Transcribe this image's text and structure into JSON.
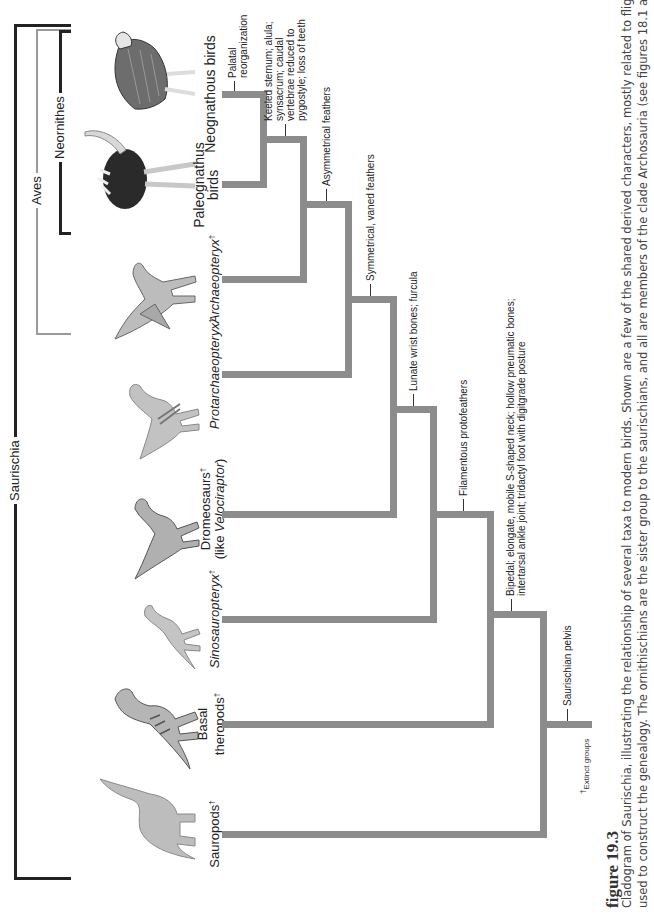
{
  "orientation": "rotated 90 degrees counterclockwise",
  "figure": {
    "title": "figure 19.3",
    "caption_line1": "Cladogram of Saurischia, illustrating the relationship of several taxa to modern birds. Shown are a few of the shared derived characters, mostly related to flight, that were",
    "caption_line2": "used to construct the genealogy. The ornithischians are the sister group to the saurischians, and all are members of the clade Archosauria (see figures 18.1 and 18.2).",
    "footnote_mark": "†",
    "footnote": "Extinct groups"
  },
  "clades": {
    "saurischia": "Saurischia",
    "aves": "Aves",
    "neornithes": "Neornithes"
  },
  "taxa": [
    {
      "id": "sauropods",
      "label": "Sauropods",
      "extinct": true,
      "italic": false
    },
    {
      "id": "basal-theropods",
      "label_line1": "Basal",
      "label_line2": "theropods",
      "extinct": true,
      "italic": false
    },
    {
      "id": "sinosauropteryx",
      "label": "Sinosauropteryx",
      "extinct": true,
      "italic": true
    },
    {
      "id": "dromeosaurs",
      "label": "Dromeosaurs",
      "sublabel_prefix": "(like ",
      "sublabel_italic": "Velociraptor",
      "sublabel_suffix": ")",
      "extinct": true
    },
    {
      "id": "protarchaeopteryx",
      "label": "Protarchaeopteryx",
      "extinct": true,
      "italic": true
    },
    {
      "id": "archaeopteryx",
      "label": "Archaeopteryx",
      "extinct": true,
      "italic": true
    },
    {
      "id": "paleognathus-birds",
      "label_line1": "Paleognathus",
      "label_line2": "birds",
      "extinct": false
    },
    {
      "id": "neognathous-birds",
      "label": "Neognathous birds",
      "extinct": false
    }
  ],
  "dagger": "†",
  "characters": {
    "saurischian_pelvis": "Saurischian pelvis",
    "bipedal_line1": "Bipedal; elongate, mobile S-shaped neck; hollow pneumatic bones;",
    "bipedal_line2": "intertarsal ankle joint; tridactyl foot with digitgrade posture",
    "filamentous": "Filamentous protofeathers",
    "lunate": "Lunate wrist bones; furcula",
    "symmetrical": "Symmetrical, vaned feathers",
    "asymmetrical": "Asymmetrical feathers",
    "keeled_line1": "Keeled sternum; alula;",
    "keeled_line2": "synsacrum; caudal",
    "keeled_line3": "vertebrae reduced to",
    "keeled_line4": "pygostyle;  loss of teeth",
    "palatal_line1": "Palatal",
    "palatal_line2": "reorganization"
  },
  "colors": {
    "branch": "#8c8c8c",
    "saurischia_bracket": "#222222",
    "aves_bracket": "#9a9a9a",
    "neornithes_bracket": "#222222",
    "caption_text": "#444444"
  }
}
